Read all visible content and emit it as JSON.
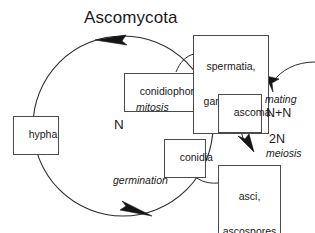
{
  "diagram": {
    "title": "Ascomycota",
    "kind": "life-cycle-diagram",
    "colors": {
      "stroke": "#2b2b2b",
      "box_border": "#4a4a4a",
      "text": "#1a1a1a",
      "background": "#ffffff"
    },
    "boxes": [
      {
        "id": "hypha",
        "text": "hypha"
      },
      {
        "id": "conidiophore",
        "text": "conidiophore"
      },
      {
        "id": "conidia",
        "text": "conidia"
      },
      {
        "id": "spermatia",
        "line1": "spermatia,",
        "line2": "gametangia"
      },
      {
        "id": "ascoma",
        "text": "ascoma"
      },
      {
        "id": "asci",
        "line1": "asci,",
        "line2": "ascospores"
      }
    ],
    "labels": [
      {
        "id": "nuclear-phase-n",
        "text": "N"
      },
      {
        "id": "mitosis",
        "text": "mitosis"
      },
      {
        "id": "germination",
        "text": "germination"
      },
      {
        "id": "mating",
        "text": "mating"
      },
      {
        "id": "dikaryon",
        "text": "N+N"
      },
      {
        "id": "diploid",
        "text": "2N"
      },
      {
        "id": "meiosis",
        "text": "meiosis"
      }
    ]
  }
}
